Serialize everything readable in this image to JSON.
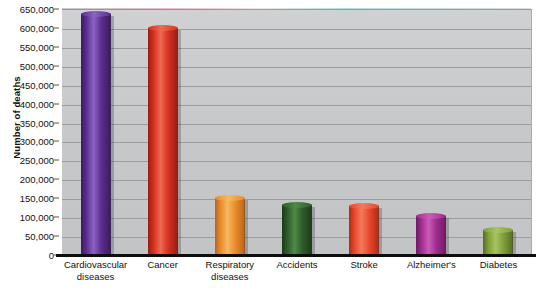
{
  "chart_data": {
    "type": "bar",
    "title": "",
    "subtitle": "",
    "xlabel": "",
    "ylabel": "Number of deaths",
    "ylim": [
      0,
      650000
    ],
    "ytick_step": 50000,
    "grid": true,
    "legend": "none",
    "categories": [
      "Cardiovascular diseases",
      "Cancer",
      "Respiratory diseases",
      "Accidents",
      "Stroke",
      "Alzheimer's",
      "Diabetes"
    ],
    "category_lines": [
      [
        "Cardiovascular",
        "diseases"
      ],
      [
        "Cancer"
      ],
      [
        "Respiratory",
        "diseases"
      ],
      [
        "Accidents"
      ],
      [
        "Stroke"
      ],
      [
        "Alzheimer's"
      ],
      [
        "Diabetes"
      ]
    ],
    "values": [
      637000,
      600000,
      151000,
      132000,
      130000,
      103000,
      66000
    ],
    "ytick_labels": [
      "650,000",
      "600,000",
      "550,000",
      "500,000",
      "450,000",
      "400,000",
      "350,000",
      "300,000",
      "250,000",
      "200,000",
      "150,000",
      "100,000",
      "50,000",
      "0"
    ],
    "ytick_values": [
      650000,
      600000,
      550000,
      500000,
      450000,
      400000,
      350000,
      300000,
      250000,
      200000,
      150000,
      100000,
      50000,
      0
    ],
    "bar_colors": [
      "#5b2d8e",
      "#d4301f",
      "#e88b2a",
      "#2e5c2a",
      "#e8472b",
      "#a02c8f",
      "#7fa03a"
    ],
    "bar_colors_light": [
      "#8a63c4",
      "#ef6a52",
      "#f6b85f",
      "#4f8a46",
      "#f4785c",
      "#c95cb6",
      "#a6c45f"
    ],
    "bar_colors_dark": [
      "#3a1a60",
      "#9a1c12",
      "#b9641a",
      "#1b3a18",
      "#ad2b16",
      "#6d1a62",
      "#566d22"
    ],
    "plot_background": "#c6c8ca",
    "gridline_color": "#9a9c9f",
    "axis_color": "#0d0d0d",
    "text_color": "#111111"
  }
}
